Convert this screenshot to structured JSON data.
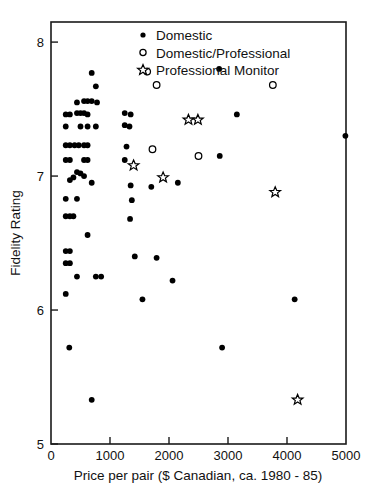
{
  "chart_data": {
    "type": "scatter",
    "title": "",
    "xlabel": "Price per pair ($ Canadian, ca. 1980 - 85)",
    "ylabel": "Fidelity Rating",
    "xlim": [
      0,
      5000
    ],
    "ylim": [
      5,
      8.15
    ],
    "xticks": [
      0,
      1000,
      2000,
      3000,
      4000,
      5000
    ],
    "xtick_labels": [
      "0",
      "1000",
      "2000",
      "3000",
      "4000",
      "5000"
    ],
    "yticks": [
      5,
      6,
      7,
      8
    ],
    "ytick_labels": [
      "5",
      "6",
      "7",
      "8"
    ],
    "grid": false,
    "legend_position": "top-center",
    "series": [
      {
        "name": "Domestic",
        "marker": "filled-circle",
        "color": "#000000",
        "points": [
          [
            690,
            7.77
          ],
          [
            760,
            7.67
          ],
          [
            440,
            7.55
          ],
          [
            560,
            7.56
          ],
          [
            620,
            7.56
          ],
          [
            690,
            7.56
          ],
          [
            780,
            7.55
          ],
          [
            250,
            7.46
          ],
          [
            320,
            7.46
          ],
          [
            440,
            7.47
          ],
          [
            500,
            7.47
          ],
          [
            560,
            7.47
          ],
          [
            620,
            7.46
          ],
          [
            1250,
            7.47
          ],
          [
            1350,
            7.46
          ],
          [
            250,
            7.37
          ],
          [
            500,
            7.37
          ],
          [
            620,
            7.37
          ],
          [
            760,
            7.37
          ],
          [
            1250,
            7.38
          ],
          [
            1330,
            7.37
          ],
          [
            2850,
            7.8
          ],
          [
            3150,
            7.46
          ],
          [
            250,
            7.23
          ],
          [
            320,
            7.23
          ],
          [
            400,
            7.23
          ],
          [
            470,
            7.23
          ],
          [
            560,
            7.23
          ],
          [
            620,
            7.23
          ],
          [
            1280,
            7.22
          ],
          [
            250,
            7.12
          ],
          [
            320,
            7.12
          ],
          [
            560,
            7.12
          ],
          [
            620,
            7.12
          ],
          [
            1250,
            7.12
          ],
          [
            2860,
            7.15
          ],
          [
            440,
            7.03
          ],
          [
            500,
            7.02
          ],
          [
            560,
            7.0
          ],
          [
            380,
            6.99
          ],
          [
            320,
            6.97
          ],
          [
            690,
            6.95
          ],
          [
            1350,
            6.93
          ],
          [
            1700,
            6.92
          ],
          [
            2150,
            6.95
          ],
          [
            4990,
            7.3
          ],
          [
            250,
            6.83
          ],
          [
            440,
            6.83
          ],
          [
            1370,
            6.82
          ],
          [
            250,
            6.7
          ],
          [
            320,
            6.7
          ],
          [
            380,
            6.7
          ],
          [
            1340,
            6.68
          ],
          [
            620,
            6.56
          ],
          [
            250,
            6.44
          ],
          [
            320,
            6.44
          ],
          [
            250,
            6.35
          ],
          [
            320,
            6.35
          ],
          [
            1420,
            6.4
          ],
          [
            1790,
            6.39
          ],
          [
            440,
            6.25
          ],
          [
            760,
            6.25
          ],
          [
            850,
            6.25
          ],
          [
            2060,
            6.22
          ],
          [
            250,
            6.12
          ],
          [
            1550,
            6.08
          ],
          [
            4130,
            6.08
          ],
          [
            310,
            5.72
          ],
          [
            2900,
            5.72
          ],
          [
            690,
            5.33
          ]
        ]
      },
      {
        "name": "Domestic/Professional",
        "marker": "open-circle",
        "color": "#000000",
        "points": [
          [
            1630,
            7.78
          ],
          [
            1790,
            7.68
          ],
          [
            3760,
            7.68
          ],
          [
            1720,
            7.2
          ],
          [
            2500,
            7.15
          ]
        ]
      },
      {
        "name": "Professional Monitor",
        "marker": "open-star",
        "color": "#000000",
        "points": [
          [
            1400,
            7.08
          ],
          [
            2330,
            7.42
          ],
          [
            2490,
            7.42
          ],
          [
            1900,
            6.99
          ],
          [
            3800,
            6.88
          ],
          [
            4180,
            5.33
          ]
        ]
      }
    ]
  },
  "legend": {
    "items": [
      {
        "label": "Domestic",
        "marker": "filled-circle-icon"
      },
      {
        "label": "Domestic/Professional",
        "marker": "open-circle-icon"
      },
      {
        "label": "Professional Monitor",
        "marker": "open-star-icon"
      }
    ]
  },
  "axes": {
    "x_title": "Price per pair ($ Canadian, ca. 1980 - 85)",
    "y_title": "Fidelity Rating"
  },
  "colors": {
    "foreground": "#000000",
    "frame": "#1a1a1a",
    "background": "#ffffff"
  }
}
